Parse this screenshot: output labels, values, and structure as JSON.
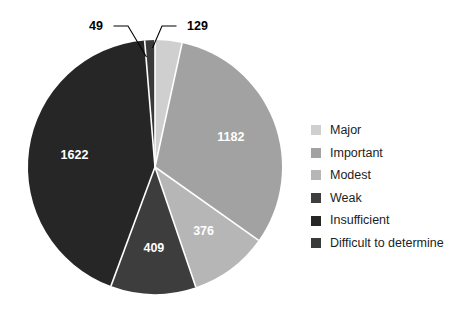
{
  "chart_data": {
    "type": "pie",
    "title": "",
    "subtitle": "",
    "xlabel": "",
    "ylabel": "",
    "total": 3767,
    "legend_position": "right",
    "grid": false,
    "start_angle_deg": 0,
    "direction": "clockwise",
    "categories": [
      "Major",
      "Important",
      "Modest",
      "Weak",
      "Insufficient",
      "Difficult to determine"
    ],
    "values": [
      129,
      1182,
      376,
      409,
      1622,
      49
    ],
    "colors": [
      "#cfcfcf",
      "#a2a2a2",
      "#b6b6b6",
      "#3d3d3d",
      "#262626",
      "#3a3a3a"
    ],
    "slices": [
      {
        "label": "Major",
        "value": 129,
        "color": "#cfcfcf",
        "label_text": "129",
        "label_style": "callout",
        "label_color": "#000000"
      },
      {
        "label": "Important",
        "value": 1182,
        "color": "#a2a2a2",
        "label_text": "1182",
        "label_style": "inside",
        "label_color": "#ffffff"
      },
      {
        "label": "Modest",
        "value": 376,
        "color": "#b6b6b6",
        "label_text": "376",
        "label_style": "inside",
        "label_color": "#ffffff"
      },
      {
        "label": "Weak",
        "value": 409,
        "color": "#3d3d3d",
        "label_text": "409",
        "label_style": "inside",
        "label_color": "#ffffff"
      },
      {
        "label": "Insufficient",
        "value": 1622,
        "color": "#262626",
        "label_text": "1622",
        "label_style": "inside",
        "label_color": "#ffffff"
      },
      {
        "label": "Difficult to determine",
        "value": 49,
        "color": "#3a3a3a",
        "label_text": "49",
        "label_style": "callout",
        "label_color": "#000000"
      }
    ]
  },
  "legend": {
    "items": [
      {
        "label": "Major",
        "color": "#cfcfcf"
      },
      {
        "label": "Important",
        "color": "#a2a2a2"
      },
      {
        "label": "Modest",
        "color": "#b6b6b6"
      },
      {
        "label": "Weak",
        "color": "#3d3d3d"
      },
      {
        "label": "Insufficient",
        "color": "#262626"
      },
      {
        "label": "Difficult to determine",
        "color": "#3a3a3a"
      }
    ]
  },
  "callouts": [
    {
      "text": "49",
      "x": 103,
      "y": 26
    },
    {
      "text": "129",
      "x": 180,
      "y": 26
    }
  ],
  "figure": {
    "background": "#ffffff",
    "center_x": 155,
    "center_y": 167,
    "radius": 127
  }
}
